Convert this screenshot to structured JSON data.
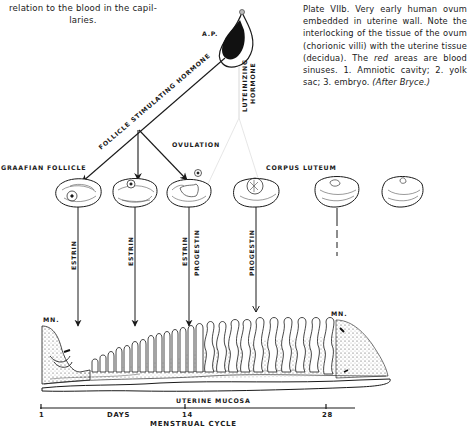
{
  "captions": {
    "left_fragment": "relation to the blood in the capil-laries.",
    "left_line1": "relation to the blood in the capil-",
    "left_line2": "laries.",
    "plate_text_prefix": "Plate VIIb. Very early human ovum embedded in uterine wall. Note the interlocking of the tissue of the ovum (chorionic villi) with the uterine tissue (decidua). The ",
    "plate_text_italic": "red",
    "plate_text_middle": " areas are blood sinuses. 1. Amniotic cavity; 2. yolk sac; 3. embryo. ",
    "plate_text_after": "(After Bryce.)"
  },
  "diagram": {
    "pituitary_label": "A.P.",
    "fsh_label": "FOLLICLE STIMULATING HORMONE",
    "lh_label_line1": "LUTEINIZING",
    "lh_label_line2": "HORMONE",
    "ovulation_label": "OVULATION",
    "graafian_label": "GRAAFIAN FOLLICLE",
    "corpus_luteum_label": "CORPUS LUTEUM",
    "hormone_arrows": [
      {
        "label1": "ESTRIN",
        "label2": ""
      },
      {
        "label1": "ESTRIN",
        "label2": ""
      },
      {
        "label1": "ESTRIN",
        "label2": "PROGESTIN"
      },
      {
        "label1": "PROGESTIN",
        "label2": ""
      }
    ],
    "mn_left": "MN.",
    "mn_right": "MN.",
    "mucosa_label": "UTERINE MUCOSA",
    "axis": {
      "ticks": [
        "1",
        "14",
        "28"
      ],
      "days_label": "DAYS",
      "title": "MENSTRUAL CYCLE"
    }
  }
}
